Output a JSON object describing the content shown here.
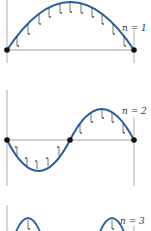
{
  "figure": {
    "colors": {
      "curve": "#2b5c9e",
      "axis": "#888888",
      "arrow": "#333333",
      "node": "#111111"
    },
    "panels": [
      {
        "label": "n = 1",
        "mode": 1
      },
      {
        "label": "n = 2",
        "mode": 2
      },
      {
        "label": "n = 3",
        "mode": 3
      }
    ]
  }
}
